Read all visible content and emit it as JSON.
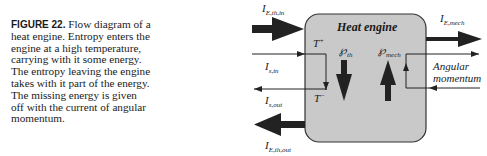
{
  "caption": {
    "figure_label": "FIGURE 22.",
    "text": "Flow diagram of a heat engine. Entropy enters the engine at a high temperature, carrying with it some energy. The entropy leaving the engine takes with it part of the energy. The missing energy is given off with the current of angular momentum."
  },
  "diagram": {
    "box_title": "Heat engine",
    "box_fill": "#c9c9c9",
    "labels": {
      "energy_thermal_in": {
        "main": "I",
        "sub": "E,th,in"
      },
      "entropy_in": {
        "main": "I",
        "sub": "s,in"
      },
      "entropy_out": {
        "main": "I",
        "sub": "s,out"
      },
      "energy_thermal_out": {
        "main": "I",
        "sub": "E,th,out"
      },
      "energy_mech": {
        "main": "I",
        "sub": "E,mech"
      },
      "temp_high": {
        "main": "T",
        "sup": "+"
      },
      "temp_low": {
        "main": "T",
        "sup": "−"
      },
      "power_thermal": {
        "main": "℘",
        "sub": "th"
      },
      "power_mech": {
        "main": "℘",
        "sub": "mech"
      },
      "angular_1": "Angular",
      "angular_2": "momentum"
    }
  }
}
